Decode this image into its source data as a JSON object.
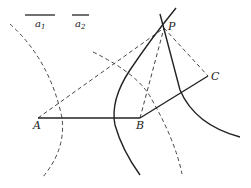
{
  "diagram": {
    "type": "geometric-construction",
    "colors": {
      "stroke": "#222222",
      "dashed": "#444444",
      "background": "#ffffff"
    },
    "points": {
      "P": {
        "label": "P",
        "x": 164,
        "y": 28
      },
      "A": {
        "label": "A",
        "x": 38,
        "y": 118
      },
      "B": {
        "label": "B",
        "x": 140,
        "y": 118
      },
      "C": {
        "label": "C",
        "x": 208,
        "y": 76
      }
    },
    "reference_segments": [
      {
        "label": "a",
        "subscript": "1",
        "x1": 25,
        "x2": 55,
        "y": 15
      },
      {
        "label": "a",
        "subscript": "2",
        "x1": 72,
        "x2": 89,
        "y": 15
      }
    ]
  }
}
